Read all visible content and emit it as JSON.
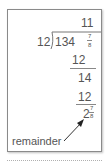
{
  "division": {
    "quotient": "11",
    "divisor": "12",
    "dividend_whole": "134",
    "dividend_frac_num": "7",
    "dividend_frac_den": "8",
    "step1_subtract": "12",
    "step1_result": "14",
    "step2_subtract": "12",
    "remainder_whole": "2",
    "remainder_frac_num": "7",
    "remainder_frac_den": "8"
  },
  "annotation": {
    "label": "remainder"
  }
}
